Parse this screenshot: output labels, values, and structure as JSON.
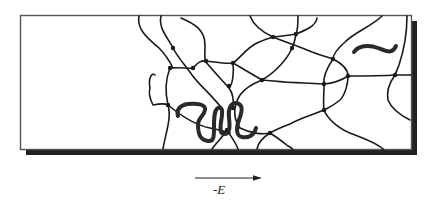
{
  "figure": {
    "colors": {
      "line": "#1a1a1a",
      "border": "#555555",
      "shadow": "#222222",
      "background": "#ffffff"
    }
  },
  "field_arrow": {
    "label": "-E",
    "direction": "right"
  },
  "elements": {
    "gel_box": "gel-box",
    "network": "gel-network",
    "migrating_chain": "dna-chain",
    "free_chain": "free-chain"
  }
}
